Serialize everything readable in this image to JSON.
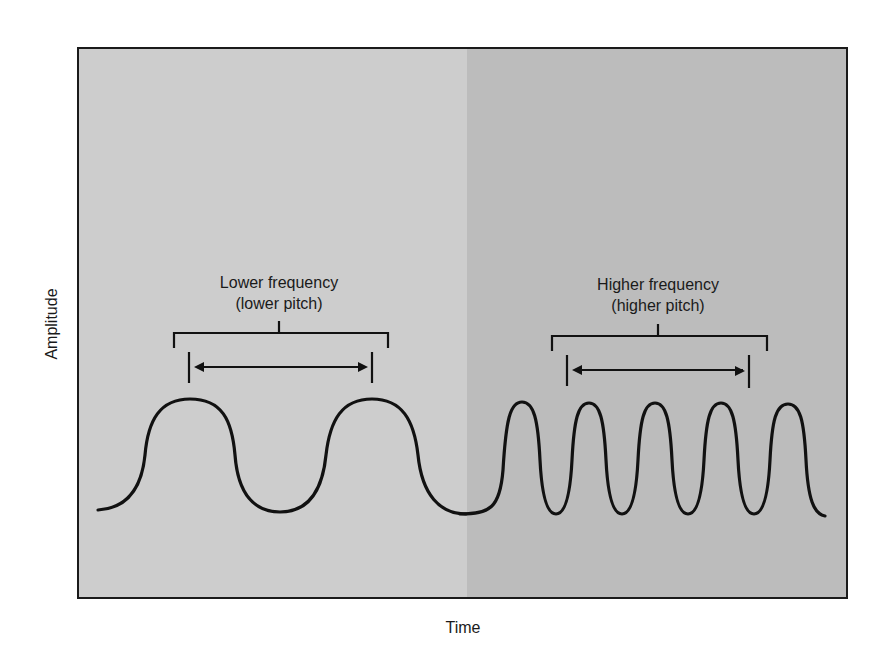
{
  "diagram": {
    "axes": {
      "y_label": "Amplitude",
      "x_label": "Time"
    },
    "annotations": {
      "low": {
        "line1": "Lower frequency",
        "line2": "(lower pitch)"
      },
      "high": {
        "line1": "Higher frequency",
        "line2": "(higher pitch)"
      }
    },
    "colors": {
      "left_panel": "#cdcdcd",
      "right_panel": "#bcbcbc",
      "frame": "#1a1a1a",
      "wave": "#111111",
      "background": "#ffffff"
    },
    "waves": {
      "lower_frequency_cycles": 2,
      "higher_frequency_cycles": 5
    }
  }
}
